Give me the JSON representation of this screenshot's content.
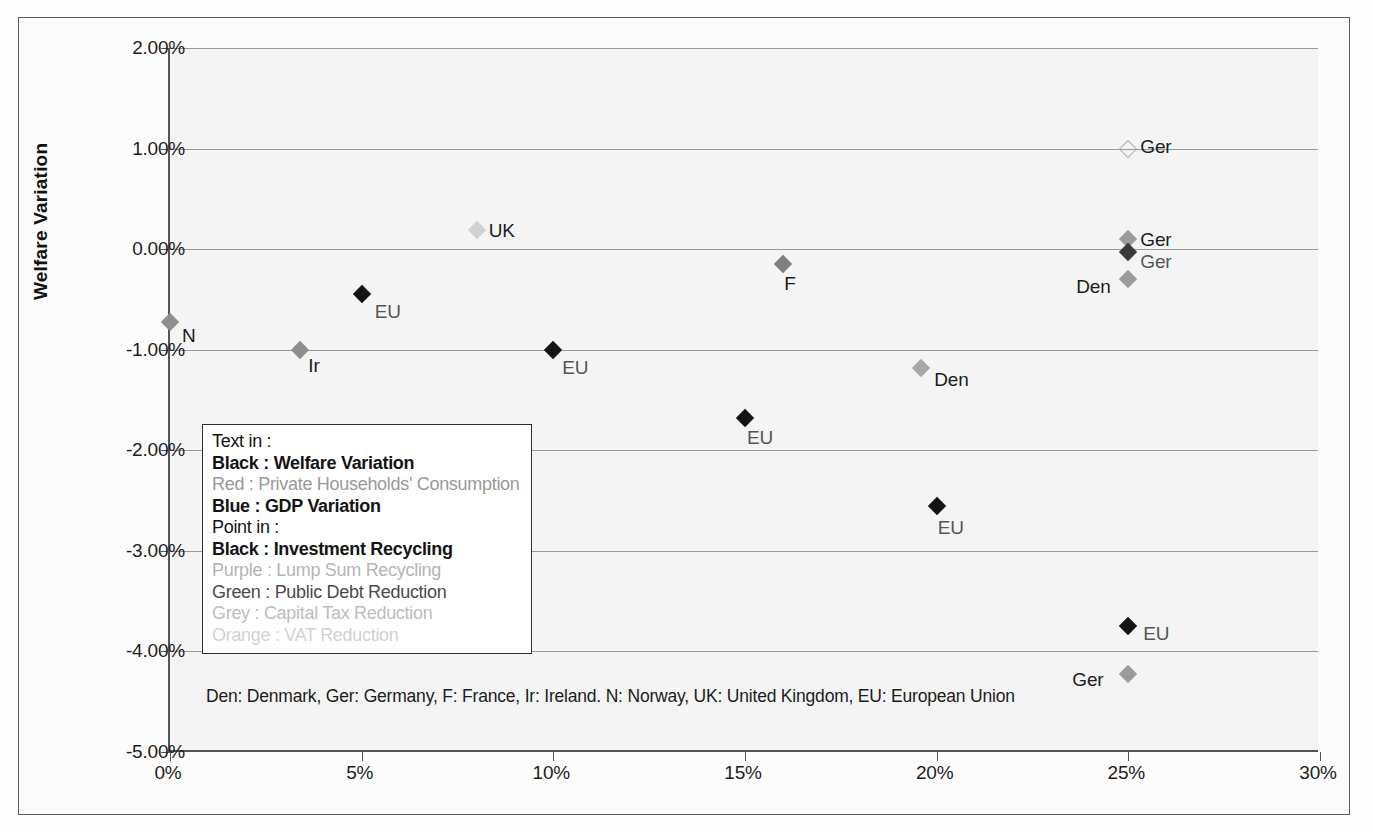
{
  "chart_data": {
    "type": "scatter",
    "title": "",
    "xlabel": "",
    "ylabel": "Welfare Variation",
    "xlim": [
      0,
      30
    ],
    "ylim": [
      -5,
      2
    ],
    "grid": true,
    "x_ticks": [
      "0%",
      "5%",
      "10%",
      "15%",
      "20%",
      "25%",
      "30%"
    ],
    "x_tick_values": [
      0,
      5,
      10,
      15,
      20,
      25,
      30
    ],
    "y_ticks": [
      "2.00%",
      "1.00%",
      "0.00%",
      "-1.00%",
      "-2.00%",
      "-3.00%",
      "-4.00%",
      "-5.00%"
    ],
    "y_tick_values": [
      2,
      1,
      0,
      -1,
      -2,
      -3,
      -4,
      -5
    ],
    "points": [
      {
        "label": "N",
        "x": 0.0,
        "y": -0.72,
        "color": "#8f8f8f",
        "filled": true,
        "label_dx": 12,
        "label_dy": 14
      },
      {
        "label": "Ir",
        "x": 3.4,
        "y": -1.0,
        "color": "#8f8f8f",
        "filled": true,
        "label_dx": 8,
        "label_dy": 16
      },
      {
        "label": "EU",
        "x": 5.0,
        "y": -0.45,
        "color": "#141414",
        "filled": true,
        "label_dx": 13,
        "label_dy": 18
      },
      {
        "label": "UK",
        "x": 8.0,
        "y": 0.19,
        "color": "#d2d2d2",
        "filled": true,
        "label_dx": 12,
        "label_dy": 1
      },
      {
        "label": "EU",
        "x": 10.0,
        "y": -1.0,
        "color": "#141414",
        "filled": true,
        "label_dx": 9,
        "label_dy": 18
      },
      {
        "label": "EU",
        "x": 15.0,
        "y": -1.68,
        "color": "#141414",
        "filled": true,
        "label_dx": 2,
        "label_dy": 20
      },
      {
        "label": "F",
        "x": 16.0,
        "y": -0.15,
        "color": "#808080",
        "filled": true,
        "label_dx": 1,
        "label_dy": 20
      },
      {
        "label": "Den",
        "x": 19.6,
        "y": -1.18,
        "color": "#a8a8a8",
        "filled": true,
        "label_dx": 13,
        "label_dy": 12
      },
      {
        "label": "EU",
        "x": 20.0,
        "y": -2.55,
        "color": "#141414",
        "filled": true,
        "label_dx": 1,
        "label_dy": 22
      },
      {
        "label": "Ger",
        "x": 25.0,
        "y": 1.0,
        "color": "#e8e8e8",
        "filled": false,
        "label_dx": 12,
        "label_dy": -2
      },
      {
        "label": "Ger",
        "x": 25.0,
        "y": 0.1,
        "color": "#9c9c9c",
        "filled": true,
        "label_dx": 12,
        "label_dy": 1
      },
      {
        "label": "Ger",
        "x": 25.0,
        "y": -0.03,
        "color": "#3a3a3a",
        "filled": true,
        "label_dx": 12,
        "label_dy": 10
      },
      {
        "label": "Den",
        "x": 25.0,
        "y": -0.3,
        "color": "#9c9c9c",
        "filled": true,
        "label_dx": -52,
        "label_dy": 8
      },
      {
        "label": "EU",
        "x": 25.0,
        "y": -3.75,
        "color": "#141414",
        "filled": true,
        "label_dx": 15,
        "label_dy": 8
      },
      {
        "label": "Ger",
        "x": 25.0,
        "y": -4.22,
        "color": "#9c9c9c",
        "filled": true,
        "label_dx": -56,
        "label_dy": 6
      }
    ],
    "legend_position": "inside-left"
  },
  "legend": {
    "lines": [
      {
        "text": "Text in :",
        "color": "#141414",
        "bold": false
      },
      {
        "text": "Black : Welfare Variation",
        "color": "#141414",
        "bold": true
      },
      {
        "text": "Red : Private Households' Consumption",
        "color": "#999999",
        "bold": false
      },
      {
        "text": "Blue : GDP Variation",
        "color": "#141414",
        "bold": true
      },
      {
        "text": "Point in :",
        "color": "#141414",
        "bold": false
      },
      {
        "text": "Black : Investment Recycling",
        "color": "#141414",
        "bold": true
      },
      {
        "text": "Purple : Lump Sum Recycling",
        "color": "#b4b4b4",
        "bold": false
      },
      {
        "text": "Green : Public Debt Reduction",
        "color": "#4a4a4a",
        "bold": false
      },
      {
        "text": "Grey : Capital Tax Reduction",
        "color": "#bdbdbd",
        "bold": false
      },
      {
        "text": "Orange : VAT Reduction",
        "color": "#d2d2d2",
        "bold": false
      }
    ]
  },
  "footnote": {
    "text": "Den: Denmark, Ger: Germany, F: France, Ir: Ireland. N: Norway, UK: United Kingdom, EU: European Union"
  },
  "colors": {
    "plot_background": "#f4f4f4",
    "gridline": "#9a9a9a",
    "axis": "#555555",
    "frame": "#5a5a5a"
  }
}
